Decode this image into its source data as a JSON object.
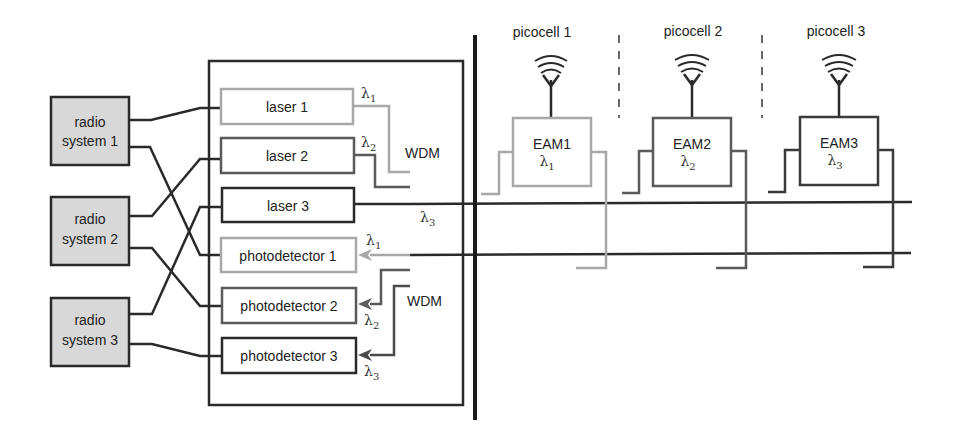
{
  "colors": {
    "dark": "#2a2a2a",
    "mid": "#5a5a5a",
    "light": "#a8a8a8",
    "radio_fill": "#d8d8d8"
  },
  "radio_systems": [
    {
      "line1": "radio",
      "line2": "system 1"
    },
    {
      "line1": "radio",
      "line2": "system 2"
    },
    {
      "line1": "radio",
      "line2": "system 3"
    }
  ],
  "central_office": {
    "lasers": [
      {
        "label": "laser 1",
        "wavelength": "λ",
        "sub": "1"
      },
      {
        "label": "laser 2",
        "wavelength": "λ",
        "sub": "2"
      },
      {
        "label": "laser 3",
        "wavelength": "λ",
        "sub": "3"
      }
    ],
    "photodetectors": [
      {
        "label": "photodetector 1",
        "wavelength": "λ",
        "sub": "1"
      },
      {
        "label": "photodetector 2",
        "wavelength": "λ",
        "sub": "2"
      },
      {
        "label": "photodetector 3",
        "wavelength": "λ",
        "sub": "3"
      }
    ],
    "wdm_top": "WDM",
    "wdm_bottom": "WDM"
  },
  "picocells": [
    {
      "label": "picocell 1",
      "eam": "EAM1",
      "wavelength": "λ",
      "sub": "1"
    },
    {
      "label": "picocell 2",
      "eam": "EAM2",
      "wavelength": "λ",
      "sub": "2"
    },
    {
      "label": "picocell 3",
      "eam": "EAM3",
      "wavelength": "λ",
      "sub": "3"
    }
  ]
}
